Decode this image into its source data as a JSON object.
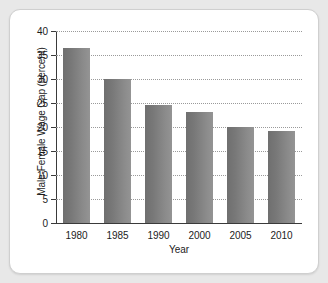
{
  "chart_data": {
    "type": "bar",
    "title": "",
    "categories": [
      "1980",
      "1985",
      "1990",
      "2000",
      "2005",
      "2010"
    ],
    "values": [
      36.5,
      30.0,
      24.6,
      23.2,
      20.0,
      19.1
    ],
    "xlabel": "Year",
    "ylabel": "Male-Female Wage Gap (percent)",
    "ylim": [
      0,
      40
    ],
    "yticks": [
      0,
      5,
      10,
      15,
      20,
      25,
      30,
      35,
      40
    ],
    "ytick_labels": [
      "0",
      "5",
      "10",
      "15",
      "20",
      "25",
      "30",
      "35",
      "40"
    ],
    "grid": "horizontal-dotted",
    "legend": "none",
    "bar_color": "#7d7d7d",
    "axis_color": "#3a3a3a",
    "gridline_color": "#9a9a9a",
    "background_color": "#ffffff",
    "page_background_color": "#e8e8e8"
  }
}
